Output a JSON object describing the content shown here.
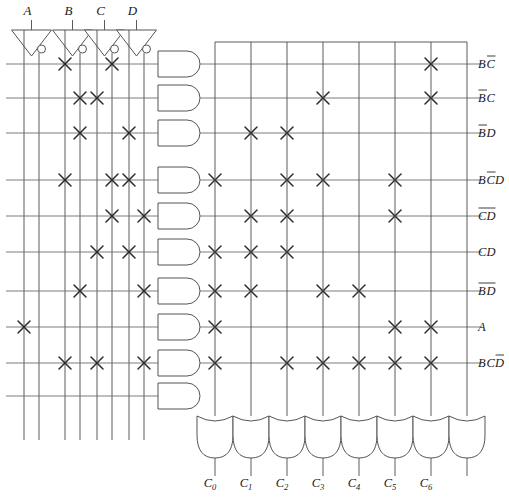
{
  "diagram": {
    "type": "pla",
    "inputs": [
      {
        "name": "A",
        "label": "A"
      },
      {
        "name": "B",
        "label": "B"
      },
      {
        "name": "C",
        "label": "C"
      },
      {
        "name": "D",
        "label": "D"
      }
    ],
    "input_columns": [
      {
        "id": 1,
        "signal": "A",
        "inverted": false
      },
      {
        "id": 2,
        "signal": "A",
        "inverted": true
      },
      {
        "id": 3,
        "signal": "B",
        "inverted": false
      },
      {
        "id": 4,
        "signal": "B",
        "inverted": true
      },
      {
        "id": 5,
        "signal": "C",
        "inverted": false
      },
      {
        "id": 6,
        "signal": "C",
        "inverted": true
      },
      {
        "id": 7,
        "signal": "D",
        "inverted": false
      },
      {
        "id": 8,
        "signal": "D",
        "inverted": true
      }
    ],
    "product_terms": [
      {
        "row": 1,
        "label_parts": [
          {
            "t": "B",
            "bar": false
          },
          {
            "t": "C",
            "bar": true
          }
        ],
        "and_cols": [
          3,
          6
        ],
        "or_cols": [
          6
        ]
      },
      {
        "row": 2,
        "label_parts": [
          {
            "t": "B",
            "bar": true
          },
          {
            "t": "C",
            "bar": false
          }
        ],
        "and_cols": [
          4,
          5
        ],
        "or_cols": [
          3,
          6
        ]
      },
      {
        "row": 3,
        "label_parts": [
          {
            "t": "B",
            "bar": true
          },
          {
            "t": "D",
            "bar": false
          }
        ],
        "and_cols": [
          4,
          7
        ],
        "or_cols": [
          1,
          2
        ]
      },
      {
        "row": 4,
        "label_parts": [
          {
            "t": "B",
            "bar": false
          },
          {
            "t": "C",
            "bar": true
          },
          {
            "t": "D",
            "bar": false
          }
        ],
        "and_cols": [
          3,
          6,
          7
        ],
        "or_cols": [
          0,
          2,
          3,
          5
        ]
      },
      {
        "row": 5,
        "label_parts": [
          {
            "t": "C",
            "bar": true
          },
          {
            "t": "D",
            "bar": true
          }
        ],
        "and_cols": [
          6,
          8
        ],
        "or_cols": [
          1,
          2,
          5
        ]
      },
      {
        "row": 6,
        "label_parts": [
          {
            "t": "C",
            "bar": false
          },
          {
            "t": "D",
            "bar": false
          }
        ],
        "and_cols": [
          5,
          7
        ],
        "or_cols": [
          0,
          1,
          2
        ]
      },
      {
        "row": 7,
        "label_parts": [
          {
            "t": "B",
            "bar": true
          },
          {
            "t": "D",
            "bar": true
          }
        ],
        "and_cols": [
          4,
          8
        ],
        "or_cols": [
          0,
          1,
          3,
          4
        ]
      },
      {
        "row": 8,
        "label_parts": [
          {
            "t": "A",
            "bar": false
          }
        ],
        "and_cols": [
          1
        ],
        "or_cols": [
          0,
          5,
          6
        ]
      },
      {
        "row": 9,
        "label_parts": [
          {
            "t": "B",
            "bar": false
          },
          {
            "t": "C",
            "bar": false
          },
          {
            "t": "D",
            "bar": true
          }
        ],
        "and_cols": [
          3,
          5,
          8
        ],
        "or_cols": [
          0,
          2,
          3,
          4,
          5,
          6
        ]
      },
      {
        "row": 10,
        "label_parts": [],
        "and_cols": [],
        "or_cols": []
      }
    ],
    "outputs": [
      {
        "index": 0,
        "base": "C",
        "sub": "0",
        "label": "C0"
      },
      {
        "index": 1,
        "base": "C",
        "sub": "1",
        "label": "C1"
      },
      {
        "index": 2,
        "base": "C",
        "sub": "2",
        "label": "C2"
      },
      {
        "index": 3,
        "base": "C",
        "sub": "3",
        "label": "C3"
      },
      {
        "index": 4,
        "base": "C",
        "sub": "4",
        "label": "C4"
      },
      {
        "index": 5,
        "base": "C",
        "sub": "5",
        "label": "C5"
      },
      {
        "index": 6,
        "base": "C",
        "sub": "6",
        "label": "C6"
      },
      {
        "index": 7,
        "base": "",
        "sub": "",
        "label": ""
      }
    ],
    "counts": {
      "and_gates": 10,
      "or_gates": 8,
      "inverters": 4,
      "input_lines": 8
    },
    "colors": {
      "wire": "#4a4a4a",
      "wire_horizontal": "#6e6e6e",
      "gate_stroke": "#555555",
      "cross": "#2b2b2b",
      "text": "#1a1a1a",
      "background": "#ffffff"
    }
  }
}
